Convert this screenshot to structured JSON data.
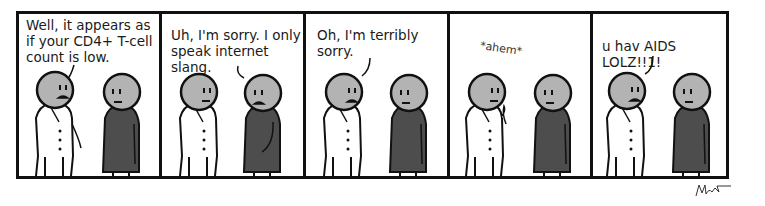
{
  "comic": {
    "panels": [
      {
        "caption": "Well, it appears as\nif your CD4+ T-cell\ncount is low.",
        "speaker": "doctor",
        "doctor_expression": "frown-mouth",
        "patient_expression": "neutral"
      },
      {
        "caption": "Uh, I'm sorry. I only\nspeak internet slang.",
        "speaker": "patient",
        "doctor_expression": "neutral",
        "patient_expression": "frown-mouth"
      },
      {
        "caption": "Oh, I'm terribly\nsorry.",
        "speaker": "doctor",
        "doctor_expression": "frown-mouth",
        "patient_expression": "neutral"
      },
      {
        "caption": "*ahem*",
        "speaker": "doctor",
        "doctor_expression": "neutral",
        "patient_expression": "neutral"
      },
      {
        "caption": "u hav AIDS LOLZ!!1!",
        "speaker": "doctor",
        "doctor_expression": "frown-mouth",
        "patient_expression": "neutral"
      }
    ],
    "signature": "Matt",
    "colors": {
      "border": "#111111",
      "head": "#b3b3b3",
      "robe": "#4d4d4d",
      "coat": "#ffffff"
    }
  }
}
